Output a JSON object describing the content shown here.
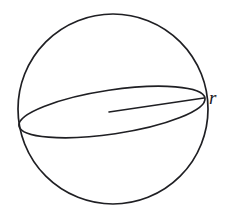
{
  "figure": {
    "background_color": "#ffffff",
    "stroke_color": "#1f1f23",
    "label_color": "#1a1a1d",
    "labels": {
      "radius": "r"
    },
    "icon_names": {
      "sphere": "sphere-outline-icon",
      "equator": "equator-ellipse-icon",
      "radius": "radius-line-icon"
    }
  },
  "geometry": {
    "canvas": {
      "width": 229,
      "height": 214
    },
    "sphere_circle": {
      "center_x": 113,
      "center_y": 109,
      "radius": 95,
      "stroke_width": 1.7
    },
    "equator_ellipse": {
      "center_x": 112,
      "center_y": 112,
      "semi_major": 94,
      "semi_minor": 22,
      "rotation_deg": -8.5,
      "stroke_width": 1.7,
      "left_vertex_x": 19,
      "left_vertex_y": 126,
      "right_vertex_x": 205,
      "right_vertex_y": 98
    },
    "radius_segment": {
      "x1": 109,
      "y1": 112,
      "x2": 204,
      "y2": 98,
      "stroke_width": 1.6
    },
    "radius_label_position": {
      "x": 211,
      "y": 99
    }
  }
}
